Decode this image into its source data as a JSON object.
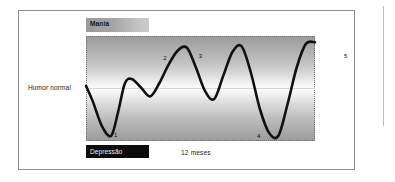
{
  "figure": {
    "top_band_label": "Mania",
    "bottom_band_label": "Depressão",
    "baseline_label": "Humor normal",
    "time_axis_caption": "12 meses"
  },
  "chart_data": {
    "type": "line",
    "title": "",
    "subtitle": "",
    "xlabel": "12 meses",
    "ylabel": "Humor normal",
    "grid": false,
    "legend": null,
    "axis_bands": [
      {
        "name": "Mania",
        "position": "top"
      },
      {
        "name": "Humor normal",
        "position": "middle"
      },
      {
        "name": "Depressão",
        "position": "bottom"
      }
    ],
    "ylim": [
      -1,
      1
    ],
    "xlim": [
      0,
      100
    ],
    "baseline": 0,
    "series": [
      {
        "name": "Humor",
        "x": [
          0,
          3,
          7,
          11,
          14,
          17,
          20,
          24,
          28,
          32,
          36,
          40,
          44,
          48,
          52,
          56,
          60,
          64,
          68,
          72,
          76,
          80,
          84,
          88,
          92,
          96,
          100
        ],
        "y": [
          0.05,
          -0.25,
          -0.72,
          -0.9,
          -0.45,
          0.1,
          0.18,
          0.02,
          -0.15,
          0.1,
          0.45,
          0.72,
          0.78,
          0.4,
          -0.05,
          -0.2,
          0.25,
          0.7,
          0.8,
          0.3,
          -0.4,
          -0.85,
          -0.9,
          -0.3,
          0.4,
          0.85,
          0.88
        ]
      }
    ],
    "annotations": [
      {
        "label": "1",
        "type": "trough",
        "x_pct": 12.5,
        "y_pct": 90,
        "placement": "below"
      },
      {
        "label": "2",
        "type": "peak",
        "x_pct": 34.0,
        "y_pct": 17,
        "placement": "above"
      },
      {
        "label": "3",
        "type": "peak",
        "x_pct": 49.5,
        "y_pct": 15,
        "placement": "above"
      },
      {
        "label": "4",
        "type": "trough",
        "x_pct": 75.0,
        "y_pct": 91,
        "placement": "below"
      },
      {
        "label": "5",
        "type": "peak",
        "x_pct": 113.0,
        "y_pct": 15,
        "placement": "above"
      },
      {
        "label": "6",
        "type": "trough",
        "x_pct": 143.0,
        "y_pct": 86,
        "placement": "below"
      }
    ]
  },
  "colors": {
    "curve": "#111111",
    "baseline": "#d8d8d8",
    "frame": "#8e8e8e",
    "depression_band": "#0b0b0b",
    "mania_band_start": "#9a9a9a",
    "mania_band_end": "#cccccc",
    "plot_border": "#6e6e6e"
  }
}
